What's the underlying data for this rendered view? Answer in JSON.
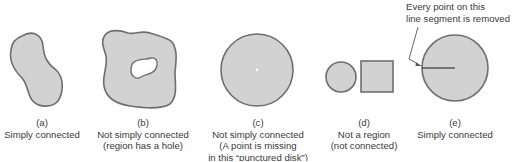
{
  "figures": [
    {
      "id": "a",
      "letter": "(a)",
      "lines": [
        "Simply connected"
      ]
    },
    {
      "id": "b",
      "letter": "(b)",
      "lines": [
        "Not simply connected",
        "(region has a hole)"
      ]
    },
    {
      "id": "c",
      "letter": "(c)",
      "lines": [
        "Not simply connected",
        "(A point is missing",
        "in this “punctured disk”)"
      ]
    },
    {
      "id": "d",
      "letter": "(d)",
      "lines": [
        "Not a region",
        "(not connected)"
      ]
    },
    {
      "id": "e",
      "letter": "(e)",
      "lines": [
        "Simply connected"
      ]
    }
  ],
  "annotation": {
    "line1": "Every point on this",
    "line2": "line segment is removed"
  },
  "colors": {
    "region_fill": "#d2d2d2",
    "region_stroke": "#6e6e6e",
    "background": "#ffffff"
  }
}
